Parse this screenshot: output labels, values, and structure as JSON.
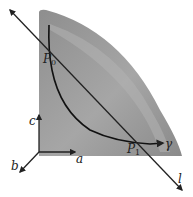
{
  "diagram": {
    "type": "geometric-surface-with-curve-and-line",
    "surface": {
      "description": "shaded region bounded by the c-axis, a-axis and a convex curved edge",
      "fill_color": "#8a8a8a",
      "highlight_color": "#a8a8a8"
    },
    "curve": {
      "label": "γ",
      "color": "#111111"
    },
    "line": {
      "label": "l",
      "color": "#222222"
    },
    "points": [
      {
        "label": "P",
        "subscript": "0"
      },
      {
        "label": "P",
        "subscript": "1"
      }
    ],
    "axes": [
      {
        "label": "a"
      },
      {
        "label": "b"
      },
      {
        "label": "c"
      }
    ]
  }
}
